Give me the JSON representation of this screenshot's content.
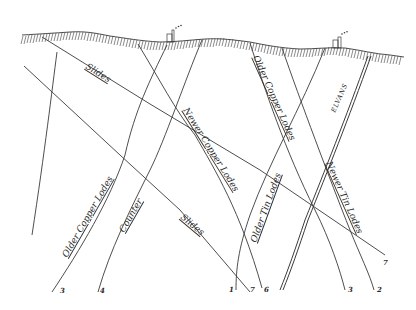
{
  "diagram": {
    "type": "geological-cross-section",
    "colors": {
      "ink": "#3a3a3a",
      "background": "#ffffff"
    },
    "surface": {
      "name": "ground-surface",
      "hatched": true
    },
    "surface_markers": [
      {
        "name": "engine-house-left",
        "icon": "engine-house-icon",
        "x": 170,
        "y": 40
      },
      {
        "name": "engine-house-right",
        "icon": "engine-house-icon",
        "x": 338,
        "y": 46
      }
    ],
    "labels": {
      "slides_upper": "Slides",
      "slides_lower": "Slides",
      "newer_copper_lodes": "Newer Copper Lodes",
      "older_copper_lodes_right": "Older Copper Lodes",
      "older_copper_lodes_left": "Older Copper Lodes",
      "counter": "Counter",
      "older_tin_lodes": "Older Tin Lodes",
      "newer_tin_lodes": "Newer Tin Lodes",
      "elvans": "ELVANS"
    },
    "line_numbers": {
      "n3_left": "3",
      "n4": "4",
      "n1": "1",
      "n7_mid": "7",
      "n6": "6",
      "n3_right": "3",
      "n2": "2",
      "n7_right": "7"
    }
  }
}
